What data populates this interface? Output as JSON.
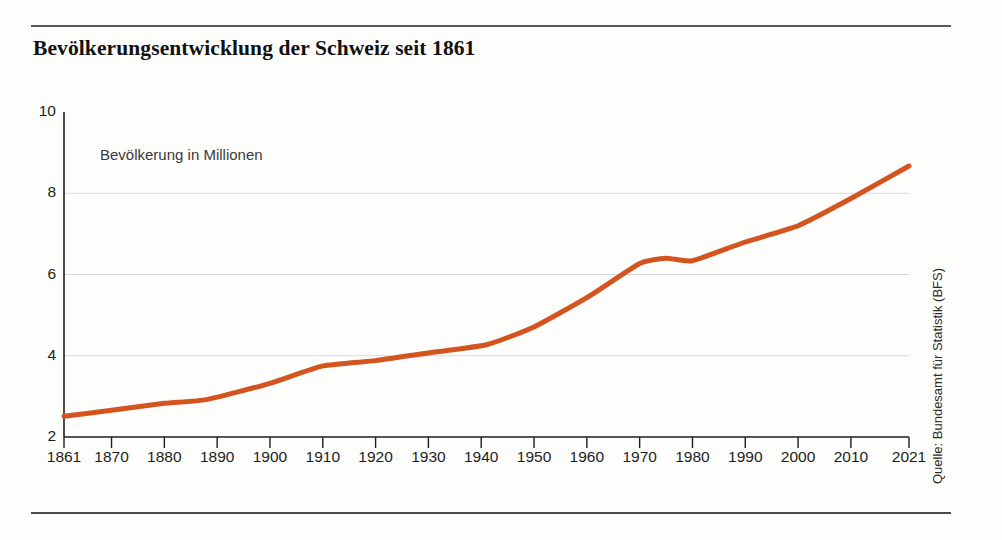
{
  "title": "Bevölkerungsentwicklung der Schweiz seit 1861",
  "source_note": "Quelle: Bundesamt für Statistik (BFS)",
  "colors": {
    "line": "#d4541f",
    "axis": "#1d1d1d",
    "grid": "#d9d9d9",
    "rule": "#595959"
  },
  "chart_data": {
    "type": "line",
    "title": "Bevölkerungsentwicklung der Schweiz seit 1861",
    "annotation": "Bevölkerung in Millionen",
    "xlabel": "",
    "ylabel": "Bevölkerung in Millionen",
    "xlim": [
      1861,
      2021
    ],
    "ylim": [
      2,
      10
    ],
    "yticks": [
      2,
      4,
      6,
      8,
      10
    ],
    "ytick_labels": [
      "2",
      "4",
      "6",
      "8",
      "10"
    ],
    "xticks": [
      1861,
      1870,
      1880,
      1890,
      1900,
      1910,
      1920,
      1930,
      1940,
      1950,
      1960,
      1970,
      1980,
      1990,
      2000,
      2010,
      2021
    ],
    "xtick_labels": [
      "1861",
      "1870",
      "1880",
      "1890",
      "1900",
      "1910",
      "1920",
      "1930",
      "1940",
      "1950",
      "1960",
      "1970",
      "1980",
      "1990",
      "2000",
      "2010",
      "2021"
    ],
    "grid": "horizontal",
    "legend": "none",
    "series": [
      {
        "name": "Bevölkerung in Millionen",
        "color": "#d4541f",
        "x": [
          1861,
          1870,
          1880,
          1888,
          1900,
          1910,
          1920,
          1930,
          1941,
          1950,
          1960,
          1970,
          1975,
          1980,
          1990,
          2000,
          2010,
          2021
        ],
        "values": [
          2.51,
          2.66,
          2.83,
          2.92,
          3.32,
          3.75,
          3.88,
          4.07,
          4.27,
          4.71,
          5.43,
          6.27,
          6.4,
          6.34,
          6.8,
          7.2,
          7.87,
          8.67
        ]
      }
    ]
  }
}
